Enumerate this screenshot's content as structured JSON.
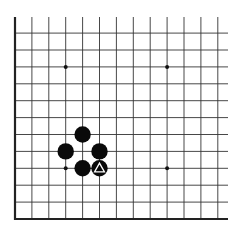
{
  "board": {
    "description": "Partial Go board diagram (bottom-left corner view)",
    "origin_x": 15,
    "origin_y": 219,
    "spacing": 16.9,
    "cols": 13,
    "rows": 12,
    "right_extent": 228,
    "top_extent": 17,
    "line_color": "#333333",
    "edge_color": "#222222",
    "background": "#ffffff"
  },
  "star_points": [
    {
      "col": 3,
      "row": 9
    },
    {
      "col": 9,
      "row": 9
    },
    {
      "col": 3,
      "row": 3
    },
    {
      "col": 9,
      "row": 3
    }
  ],
  "stones": [
    {
      "color": "black",
      "col": 4,
      "row": 5,
      "marker": null
    },
    {
      "color": "black",
      "col": 3,
      "row": 4,
      "marker": null
    },
    {
      "color": "black",
      "col": 5,
      "row": 4,
      "marker": null
    },
    {
      "color": "black",
      "col": 4,
      "row": 3,
      "marker": null
    },
    {
      "color": "black",
      "col": 5,
      "row": 3,
      "marker": "triangle"
    }
  ],
  "last_move_marker": {
    "shape": "triangle",
    "color": "#ffffff",
    "col": 5,
    "row": 3
  }
}
